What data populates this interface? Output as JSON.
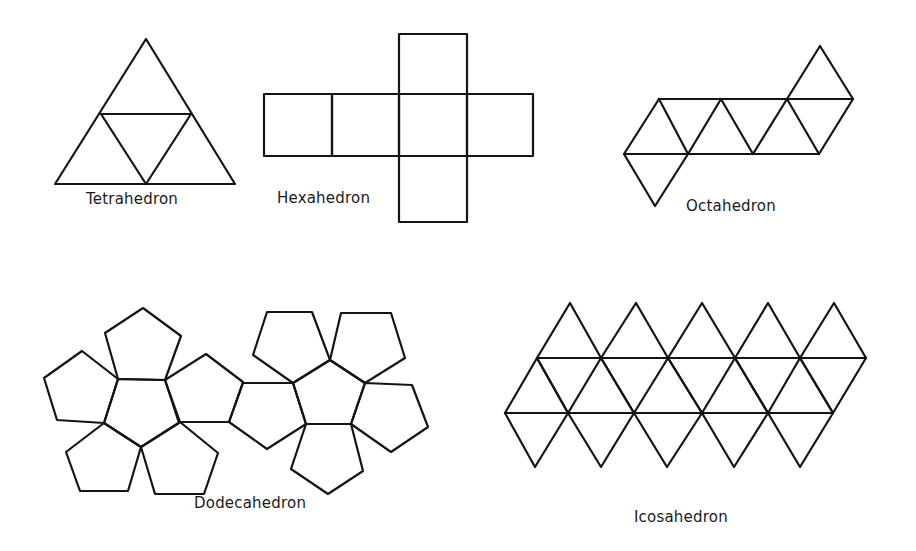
{
  "figure": {
    "background": "#ffffff",
    "stroke_color": "#141414",
    "nets": [
      {
        "id": "tetrahedron",
        "label": "Tetrahedron",
        "label_pos": [
          86,
          190
        ],
        "polygons": [
          [
            [
              146,
              39
            ],
            [
              55,
              184
            ],
            [
              235,
              184
            ]
          ],
          [
            [
              101,
              114
            ],
            [
              191,
              114
            ],
            [
              146,
              184
            ]
          ]
        ]
      },
      {
        "id": "hexahedron",
        "label": "Hexahedron",
        "label_pos": [
          277,
          189
        ],
        "polygons": [
          [
            [
              264,
              94
            ],
            [
              332,
              94
            ],
            [
              332,
              156
            ],
            [
              264,
              156
            ]
          ],
          [
            [
              332,
              94
            ],
            [
              399,
              94
            ],
            [
              399,
              156
            ],
            [
              332,
              156
            ]
          ],
          [
            [
              399,
              94
            ],
            [
              467,
              94
            ],
            [
              467,
              156
            ],
            [
              399,
              156
            ]
          ],
          [
            [
              467,
              94
            ],
            [
              533,
              94
            ],
            [
              533,
              156
            ],
            [
              467,
              156
            ]
          ],
          [
            [
              399,
              34
            ],
            [
              467,
              34
            ],
            [
              467,
              94
            ],
            [
              399,
              94
            ]
          ],
          [
            [
              399,
              156
            ],
            [
              467,
              156
            ],
            [
              467,
              222
            ],
            [
              399,
              222
            ]
          ]
        ]
      },
      {
        "id": "octahedron",
        "label": "Octahedron",
        "label_pos": [
          686,
          197
        ],
        "polygons": [
          [
            [
              659,
              99
            ],
            [
              853,
              99
            ]
          ],
          [
            [
              624,
              154
            ],
            [
              819,
              154
            ]
          ],
          [
            [
              659,
              99
            ],
            [
              624,
              154
            ],
            [
              655,
              206
            ],
            [
              688,
              154
            ]
          ],
          [
            [
              659,
              99
            ],
            [
              688,
              154
            ],
            [
              721,
              99
            ],
            [
              753,
              154
            ],
            [
              787,
              99
            ],
            [
              819,
              154
            ],
            [
              853,
              99
            ],
            [
              820,
              46
            ],
            [
              787,
              99
            ]
          ]
        ]
      },
      {
        "id": "dodecahedron",
        "label": "Dodecahedron",
        "label_pos": [
          194,
          494
        ],
        "polygons": [
          [
            [
              118,
              379
            ],
            [
              165,
              380
            ],
            [
              179,
              423
            ],
            [
              141,
              447
            ],
            [
              104,
              423
            ]
          ],
          [
            [
              118,
              379
            ],
            [
              105,
              333
            ],
            [
              143,
              308
            ],
            [
              181,
              336
            ],
            [
              165,
              380
            ]
          ],
          [
            [
              118,
              379
            ],
            [
              82,
              351
            ],
            [
              44,
              378
            ],
            [
              57,
              420
            ],
            [
              104,
              423
            ]
          ],
          [
            [
              165,
              380
            ],
            [
              206,
              354
            ],
            [
              243,
              382
            ],
            [
              229,
              422
            ],
            [
              180,
              422
            ]
          ],
          [
            [
              104,
              423
            ],
            [
              141,
              447
            ],
            [
              128,
              491
            ],
            [
              80,
              491
            ],
            [
              66,
              452
            ]
          ],
          [
            [
              141,
              447
            ],
            [
              180,
              422
            ],
            [
              218,
              453
            ],
            [
              204,
              494
            ],
            [
              155,
              494
            ]
          ],
          [
            [
              330,
              360
            ],
            [
              365,
              383
            ],
            [
              351,
              424
            ],
            [
              306,
              424
            ],
            [
              293,
              383
            ]
          ],
          [
            [
              253,
              355
            ],
            [
              267,
              312
            ],
            [
              312,
              312
            ],
            [
              330,
              360
            ],
            [
              293,
              383
            ]
          ],
          [
            [
              330,
              360
            ],
            [
              341,
              313
            ],
            [
              391,
              313
            ],
            [
              405,
              358
            ],
            [
              365,
              383
            ]
          ],
          [
            [
              365,
              383
            ],
            [
              412,
              385
            ],
            [
              428,
              427
            ],
            [
              391,
              452
            ],
            [
              351,
              424
            ]
          ],
          [
            [
              306,
              424
            ],
            [
              351,
              424
            ],
            [
              363,
              471
            ],
            [
              328,
              494
            ],
            [
              291,
              469
            ]
          ],
          [
            [
              243,
              383
            ],
            [
              293,
              383
            ],
            [
              306,
              424
            ],
            [
              267,
              449
            ],
            [
              229,
              422
            ]
          ]
        ]
      },
      {
        "id": "icosahedron",
        "label": "Icosahedron",
        "label_pos": [
          634,
          508
        ],
        "polygons": [
          [
            [
              537,
              358
            ],
            [
              866,
              358
            ]
          ],
          [
            [
              505,
              413
            ],
            [
              833,
              413
            ]
          ],
          [
            [
              537,
              358
            ],
            [
              570,
              303
            ],
            [
              601,
              358
            ],
            [
              636,
              303
            ],
            [
              668,
              358
            ],
            [
              702,
              303
            ],
            [
              735,
              358
            ],
            [
              768,
              303
            ],
            [
              800,
              358
            ],
            [
              834,
              303
            ],
            [
              866,
              358
            ]
          ],
          [
            [
              505,
              413
            ],
            [
              537,
              358
            ],
            [
              568,
              413
            ],
            [
              601,
              358
            ],
            [
              634,
              413
            ],
            [
              668,
              358
            ],
            [
              702,
              413
            ],
            [
              735,
              358
            ],
            [
              768,
              413
            ],
            [
              800,
              358
            ],
            [
              833,
              413
            ],
            [
              866,
              358
            ]
          ],
          [
            [
              505,
              413
            ],
            [
              535,
              467
            ],
            [
              568,
              413
            ],
            [
              601,
              467
            ],
            [
              634,
              413
            ],
            [
              667,
              467
            ],
            [
              702,
              413
            ],
            [
              734,
              467
            ],
            [
              768,
              413
            ],
            [
              800,
              467
            ],
            [
              833,
              413
            ]
          ],
          [
            [
              537,
              358
            ],
            [
              568,
              413
            ]
          ],
          [
            [
              601,
              358
            ],
            [
              634,
              413
            ]
          ],
          [
            [
              668,
              358
            ],
            [
              702,
              413
            ]
          ],
          [
            [
              735,
              358
            ],
            [
              768,
              413
            ]
          ],
          [
            [
              800,
              358
            ],
            [
              833,
              413
            ]
          ]
        ]
      }
    ]
  }
}
